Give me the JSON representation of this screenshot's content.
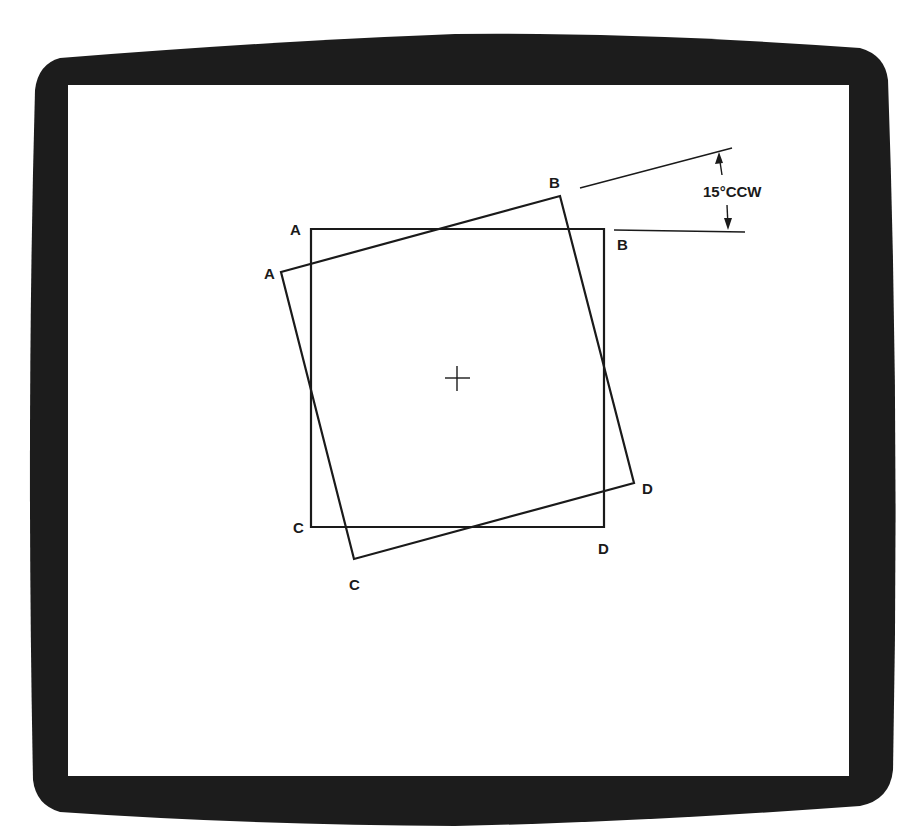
{
  "diagram": {
    "type": "rotation-illustration",
    "screen": {
      "bezel_color": "#1c1c1c",
      "screen_color": "#ffffff"
    },
    "original_square": {
      "vertices": {
        "A": {
          "label": "A",
          "x": 311,
          "y": 229
        },
        "B": {
          "label": "B",
          "x": 604,
          "y": 229
        },
        "C": {
          "label": "C",
          "x": 311,
          "y": 527
        },
        "D": {
          "label": "D",
          "x": 604,
          "y": 527
        }
      }
    },
    "rotated_square": {
      "rotation": "15°CCW",
      "vertices": {
        "A": {
          "label": "A",
          "x": 281,
          "y": 272
        },
        "B": {
          "label": "B",
          "x": 560,
          "y": 196
        },
        "C": {
          "label": "C",
          "x": 354,
          "y": 559
        },
        "D": {
          "label": "D",
          "x": 634,
          "y": 483
        }
      }
    },
    "center_mark": {
      "symbol": "+",
      "x": 457,
      "y": 378
    },
    "dimension": {
      "label": "15°CCW",
      "angle_degrees": 15,
      "direction": "CCW"
    },
    "labels": {
      "orig_A": "A",
      "orig_B": "B",
      "orig_C": "C",
      "orig_D": "D",
      "rot_A": "A",
      "rot_B": "B",
      "rot_C": "C",
      "rot_D": "D"
    }
  }
}
